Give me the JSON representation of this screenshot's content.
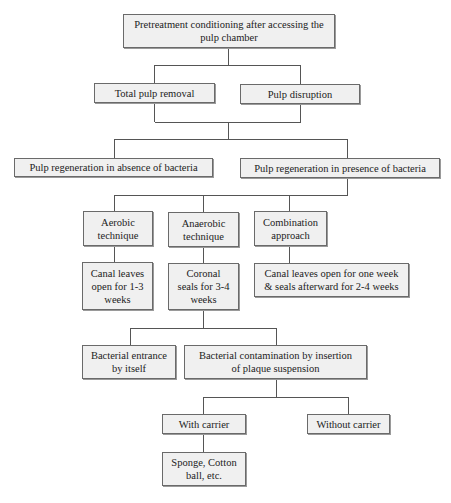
{
  "diagram": {
    "type": "flowchart",
    "colors": {
      "box_fill": "#f0f0f0",
      "box_border": "#6a6a6a",
      "line": "#555555",
      "text": "#222222"
    },
    "nodes": {
      "root": "Pretreatment conditioning after accessing the\npulp chamber",
      "total_removal": "Total pulp removal",
      "disruption": "Pulp disruption",
      "absence": "Pulp regeneration in absence of bacteria",
      "presence": "Pulp regeneration in presence of bacteria",
      "aerobic": "Aerobic\ntechnique",
      "anaerobic": "Anaerobic\ntechnique",
      "combination": "Combination\napproach",
      "aerobic_detail": "Canal  leaves\nopen for 1-3\nweeks",
      "anaerobic_detail": "Coronal\nseals for 3-4\nweeks",
      "combination_detail": "Canal  leaves open for one week\n& seals afterward for 2-4 weeks",
      "self_entrance": "Bacterial entrance\nby itself",
      "plaque_insertion": "Bacterial contamination by insertion\nof plaque suspension",
      "with_carrier": "With carrier",
      "without_carrier": "Without carrier",
      "carrier_examples": "Sponge, Cotton\nball, etc."
    },
    "edges": [
      [
        "root",
        "total_removal"
      ],
      [
        "root",
        "disruption"
      ],
      [
        "total_removal",
        "absence"
      ],
      [
        "disruption",
        "absence"
      ],
      [
        "total_removal",
        "presence"
      ],
      [
        "disruption",
        "presence"
      ],
      [
        "presence",
        "aerobic"
      ],
      [
        "presence",
        "anaerobic"
      ],
      [
        "presence",
        "combination"
      ],
      [
        "aerobic",
        "aerobic_detail"
      ],
      [
        "anaerobic",
        "anaerobic_detail"
      ],
      [
        "combination",
        "combination_detail"
      ],
      [
        "anaerobic_detail",
        "self_entrance"
      ],
      [
        "anaerobic_detail",
        "plaque_insertion"
      ],
      [
        "plaque_insertion",
        "with_carrier"
      ],
      [
        "plaque_insertion",
        "without_carrier"
      ],
      [
        "with_carrier",
        "carrier_examples"
      ]
    ]
  }
}
